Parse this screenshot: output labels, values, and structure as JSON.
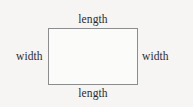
{
  "figure": {
    "kind": "rectangle-dimension-diagram",
    "background_color": "#f6f5f3",
    "shape": {
      "name": "rectangle",
      "stroke_color": "#8d8d8d",
      "fill_color": "#fbfbfa"
    },
    "text_color": "#2b2b2b",
    "labels": {
      "top": "length",
      "bottom": "length",
      "left": "width",
      "right": "width"
    }
  }
}
